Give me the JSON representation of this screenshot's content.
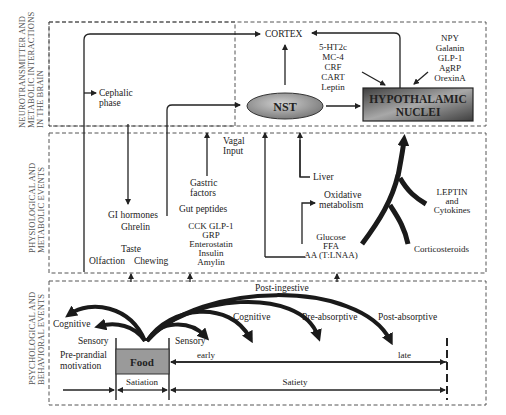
{
  "panels": {
    "brain": {
      "label_lines": [
        "NEUROTRANSMITTER AND",
        "METABOLIC INTERACTIONS",
        "IN THE BRAIN"
      ]
    },
    "physiological": {
      "label_lines": [
        "PHYSIOLOGICAL AND",
        "METABOLIC EVENTS"
      ]
    },
    "behavioral": {
      "label_lines": [
        "PSYCHOLOGICAL AND",
        "BEHAVIORAL EVENTS"
      ]
    }
  },
  "brain": {
    "cortex": "CORTEX",
    "cephalic": [
      "Cephalic",
      "phase"
    ],
    "nst": "NST",
    "hypothalamic": [
      "HYPOTHALAMIC",
      "NUCLEI"
    ],
    "left_mediators": [
      "5-HT2c",
      "MC-4",
      "CRF",
      "CART",
      "Leptin"
    ],
    "right_mediators": [
      "NPY",
      "Galanin",
      "GLP-1",
      "AgRP",
      "OrexinA"
    ]
  },
  "physiology": {
    "vagal": [
      "Vagal",
      "Input"
    ],
    "gastric": [
      "Gastric",
      "factors"
    ],
    "gut_peptides": "Gut peptides",
    "peptide_list": [
      "CCK  GLP-1",
      "GRP",
      "Enterostatin",
      "Insulin",
      "Amylin"
    ],
    "gi_hormones": "GI hormones",
    "ghrelin": "Ghrelin",
    "taste": "Taste",
    "olfaction": "Olfaction",
    "chewing": "Chewing",
    "liver": "Liver",
    "oxidative": [
      "Oxidative",
      "metabolism"
    ],
    "nutrients": [
      "Glucose",
      "FFA",
      "AA (T:LNAA)"
    ],
    "leptin": [
      "LEPTIN",
      "and",
      "Cytokines"
    ],
    "corticosteroids": "Corticosteroids"
  },
  "behavior": {
    "post_ingestive": "Post-ingestive",
    "cognitive_left": "Cognitive",
    "sensory_left": "Sensory",
    "cognitive_right": "Cognitive",
    "sensory_right": "Sensory",
    "pre_absorptive": "Pre-absorptive",
    "post_absorptive": "Post-absorptive",
    "pre_prandial": [
      "Pre-prandial",
      "motivation"
    ],
    "food": "Food",
    "early": "early",
    "late": "late",
    "satiation": "Satiation",
    "satiety": "Satiety"
  },
  "colors": {
    "food_box": "#9a9a9a",
    "hypothalamic_dark": "#4a4a4a",
    "hypothalamic_light": "#b0b0b0",
    "nst_fill": "#9a9a9a",
    "line": "#222222",
    "dash": "#555555"
  }
}
